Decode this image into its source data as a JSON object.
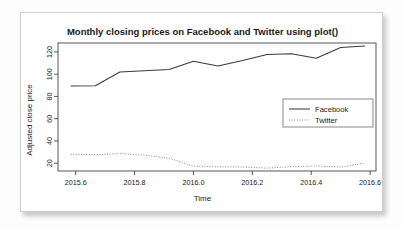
{
  "card": {
    "name": "r-plot-figure"
  },
  "chart_data": {
    "type": "line",
    "title": "Monthly closing prices on Facebook and Twitter using plot()",
    "xlabel": "Time",
    "ylabel": "Adjusted close price",
    "xlim": [
      2015.54,
      2016.62
    ],
    "ylim": [
      13,
      128
    ],
    "xticks": [
      2015.6,
      2015.8,
      2016.0,
      2016.2,
      2016.4,
      2016.6
    ],
    "xticklabels": [
      "2015.6",
      "2015.8",
      "2016.0",
      "2016.2",
      "2016.4",
      "2016.6"
    ],
    "yticks": [
      20,
      40,
      60,
      80,
      100,
      120
    ],
    "yticklabels": [
      "20",
      "40",
      "60",
      "80",
      "100",
      "120"
    ],
    "grid": false,
    "legend": {
      "position": "right-center",
      "entries": [
        {
          "name": "Facebook",
          "style": "solid",
          "color": "#3a3a3a"
        },
        {
          "name": "Twitter",
          "style": "dotted",
          "color": "#8a8a8a"
        }
      ]
    },
    "x": [
      2015.583,
      2015.667,
      2015.75,
      2015.833,
      2015.917,
      2016.0,
      2016.083,
      2016.167,
      2016.25,
      2016.333,
      2016.417,
      2016.5,
      2016.583
    ],
    "series": [
      {
        "name": "Facebook",
        "style": "solid",
        "color": "#3a3a3a",
        "values": [
          89.4,
          89.6,
          101.9,
          103.0,
          104.2,
          111.6,
          107.3,
          112.2,
          117.6,
          118.3,
          114.3,
          124.0,
          125.3
        ]
      },
      {
        "name": "Twitter",
        "style": "dotted",
        "color": "#8a8a8a",
        "values": [
          28.0,
          27.7,
          28.6,
          27.3,
          24.4,
          17.4,
          16.8,
          16.6,
          15.6,
          16.9,
          17.5,
          16.5,
          20.2
        ]
      }
    ]
  }
}
